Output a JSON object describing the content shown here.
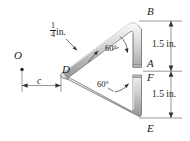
{
  "figure": {
    "points": {
      "O": "O",
      "B": "B",
      "A": "A",
      "F": "F",
      "E": "E",
      "D": "D"
    },
    "dimensions": {
      "thickness_numerator": "1",
      "thickness_denominator": "4",
      "thickness_unit": "in.",
      "upper_height": "1.5 in.",
      "lower_height": "1.5 in.",
      "offset_symbol": "c"
    },
    "angles": {
      "upper": "60°",
      "lower": "60°"
    },
    "colors": {
      "rod_light": "#e8e8e8",
      "rod_mid": "#c9c9c9",
      "rod_dark": "#9a9a9a",
      "outline": "#6e6e6e",
      "text": "#1a1a1a",
      "dimension_line": "#555555",
      "background": "#ffffff"
    }
  }
}
